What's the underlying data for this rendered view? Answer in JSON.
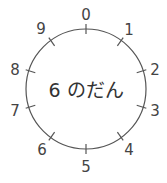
{
  "diagram": {
    "center_text": "6 のだん",
    "labels": [
      "0",
      "1",
      "2",
      "3",
      "4",
      "5",
      "6",
      "7",
      "8",
      "9"
    ],
    "stroke_color": "#555555",
    "text_color": "#444444"
  }
}
